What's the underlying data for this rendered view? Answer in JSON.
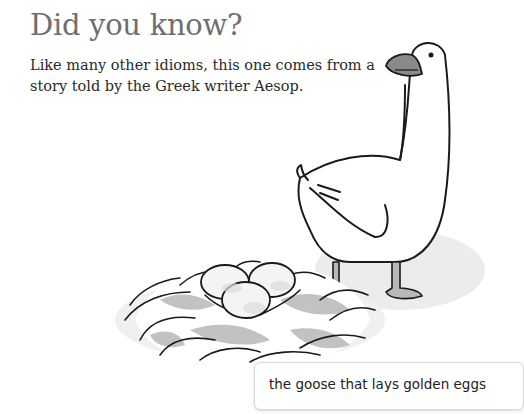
{
  "heading": "Did you know?",
  "body": "Like many other idioms, this one comes from a story told by the Greek writer Aesop.",
  "illustration": {
    "subject": "goose-standing-beside-nest-of-eggs",
    "colors": {
      "line": "#1a1a1a",
      "shadow": "#b8b8b8",
      "beak": "#8a8a8a",
      "egg": "#f4f4f4"
    }
  },
  "caption": "the goose that lays golden eggs"
}
